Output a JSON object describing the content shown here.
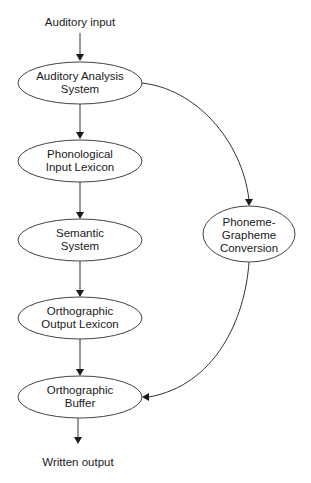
{
  "diagram": {
    "type": "flowchart",
    "input_label": "Auditory input",
    "output_label": "Written output",
    "nodes": [
      {
        "id": "aas",
        "lines": [
          "Auditory Analysis",
          "System"
        ]
      },
      {
        "id": "pil",
        "lines": [
          "Phonological",
          "Input Lexicon"
        ]
      },
      {
        "id": "sem",
        "lines": [
          "Semantic",
          "System"
        ]
      },
      {
        "id": "ool",
        "lines": [
          "Orthographic",
          "Output Lexicon"
        ]
      },
      {
        "id": "ob",
        "lines": [
          "Orthographic",
          "Buffer"
        ]
      },
      {
        "id": "pgc",
        "lines": [
          "Phoneme-",
          "Grapheme",
          "Conversion"
        ]
      }
    ],
    "edges": [
      {
        "from": "input",
        "to": "aas"
      },
      {
        "from": "aas",
        "to": "pil"
      },
      {
        "from": "pil",
        "to": "sem"
      },
      {
        "from": "sem",
        "to": "ool"
      },
      {
        "from": "ool",
        "to": "ob"
      },
      {
        "from": "ob",
        "to": "output"
      },
      {
        "from": "aas",
        "to": "pgc"
      },
      {
        "from": "pgc",
        "to": "ob"
      }
    ],
    "colors": {
      "stroke": "#333333",
      "text": "#1a1a1a",
      "background": "#ffffff"
    }
  }
}
